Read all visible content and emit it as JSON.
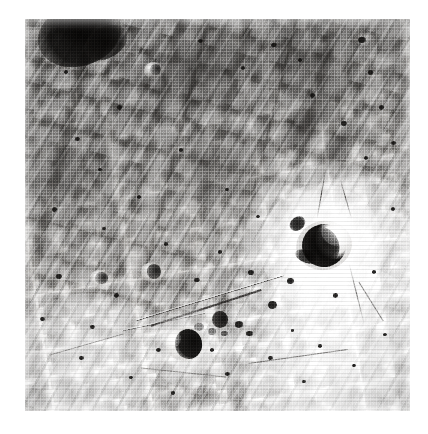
{
  "page": {
    "background_color": "#ffffff",
    "width": 428,
    "height": 434,
    "caption": ""
  },
  "photograph": {
    "name": "lunar-surface-photograph",
    "subject": "Lunar highland terrain with bright-rayed impact crater",
    "medium": "black-and-white photographic print",
    "alt_text": "Grainy monochrome photograph of a cratered lunar surface. A prominent crater with a bright ejecta halo and dark crescent-shaped interior shadow sits right of centre; a smaller shadowed crater lies below-left, and a linear rille runs toward the lower left. Rough mottled highland terrain fills the upper half, brighter washed-out plains fill the lower right.",
    "frame": {
      "left": 25,
      "top": 19,
      "width": 385,
      "height": 392
    },
    "tone": {
      "highlight": "#f4f3f1",
      "midtone": "#b0aeab",
      "shadow": "#1a1918",
      "deep_shadow": "#0c0b0a",
      "paper": "#ffffff"
    },
    "illumination": {
      "sun_direction": "from the east (right)",
      "shadow_direction": "west-southwest"
    }
  },
  "features": {
    "primary_crater": {
      "label": "main bright-haloed crater",
      "center_x_pct": 76,
      "center_y_pct": 58,
      "diameter_pct": 14,
      "description": "Fresh impact crater with bright ejecta blanket and deep crescent shadow on its western interior wall"
    },
    "secondary_crater": {
      "label": "shadowed crater south-west of main crater",
      "center_x_pct": 41,
      "center_y_pct": 82,
      "diameter_pct": 9,
      "description": "Bowl-shaped crater with dark shadow filling its eastern half"
    },
    "dark_shadow_nw": {
      "label": "deep shadow on north-west crater rim",
      "center_x_pct": 11,
      "center_y_pct": 6,
      "description": "Large black shadow cast by a highland massif at the top-left corner"
    },
    "rille": {
      "label": "linear rille / crater chain",
      "description": "Narrow straight furrow running north-east to south-west from near the main crater"
    },
    "small_craters_count": 46
  }
}
